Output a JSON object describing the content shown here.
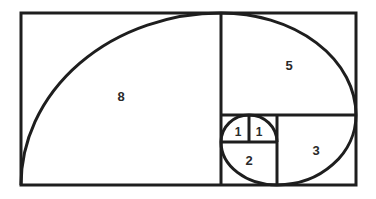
{
  "diagram": {
    "type": "fibonacci-golden-spiral",
    "line_color": "#1e1e1e",
    "background": "#ffffff",
    "squares": [
      {
        "label": "8",
        "size": 8
      },
      {
        "label": "5",
        "size": 5
      },
      {
        "label": "3",
        "size": 3
      },
      {
        "label": "2",
        "size": 2
      },
      {
        "label": "1",
        "size": 1
      },
      {
        "label": "1",
        "size": 1
      }
    ]
  }
}
